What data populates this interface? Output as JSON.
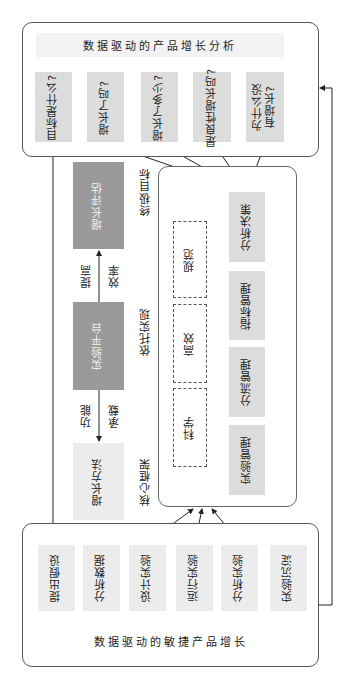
{
  "top_panel": {
    "title": "数据驱动的产品增长分析",
    "steps": [
      {
        "label": "目标是什么?"
      },
      {
        "label": "增长了吗?"
      },
      {
        "label": "增长了多少?"
      },
      {
        "label": "是良性增长吗?"
      },
      {
        "label": "为什么没有增长?"
      }
    ]
  },
  "left_column": {
    "growth_eval": "增长评估",
    "platform": "实验平台",
    "growth_method": "增长方法",
    "edge_top_left": "提高",
    "edge_top_right": "效率",
    "edge_bottom_left": "功能",
    "edge_bottom_right": "承载"
  },
  "side_labels": {
    "ultimate_goal": "终极目标",
    "rely_on": "依托实现",
    "core_framework": "核心框架"
  },
  "inner_panel": {
    "principles": [
      "规范",
      "高效",
      "科学"
    ],
    "modules": [
      "分析决策",
      "指标管理",
      "分流管理",
      "实验管理"
    ]
  },
  "bottom_panel": {
    "title": "数据驱动的敏捷产品增长",
    "steps": [
      {
        "label": "提出假设"
      },
      {
        "label": "分析数据"
      },
      {
        "label": "设计实验"
      },
      {
        "label": "运行实验"
      },
      {
        "label": "分析实验"
      },
      {
        "label": "实验沉淀"
      }
    ]
  },
  "colors": {
    "light_box": "#dcdcdc",
    "dark_box": "#9a9a9a",
    "line": "#333333"
  }
}
